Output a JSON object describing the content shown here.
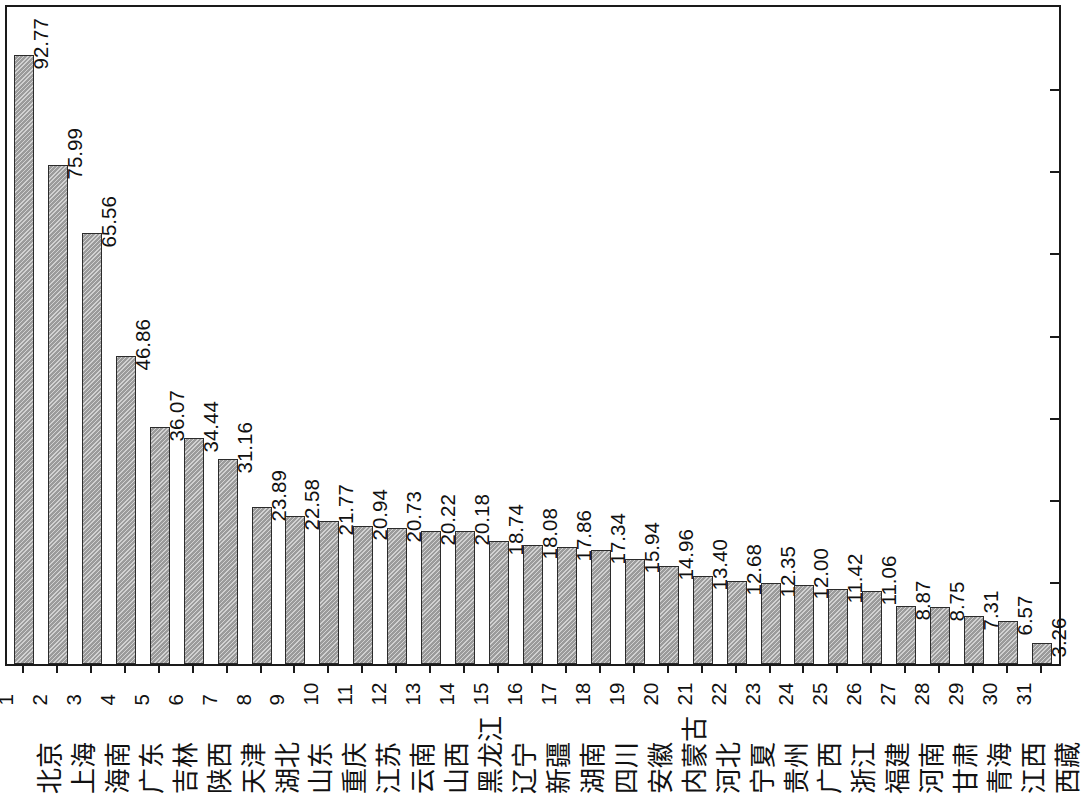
{
  "chart_data": {
    "type": "bar",
    "title": "",
    "subtitle": "",
    "xlabel": "",
    "ylabel": "",
    "ylim": [
      0,
      100
    ],
    "grid": false,
    "legend": false,
    "axis": {
      "y_ticks_labeled": false,
      "y_tick_count": 7,
      "x_tick_marks": true,
      "value_labels_rotated_deg": 90,
      "category_labels_rotated_deg": 90
    },
    "style": {
      "bar_fill": "#9b9b9b",
      "bar_border": "#2b2b2b",
      "frame_color": "#1a1a1a",
      "background": "#ffffff",
      "text_color": "#111111"
    },
    "categories": [
      "北京",
      "上海",
      "海南",
      "广东",
      "吉林",
      "陕西",
      "天津",
      "湖北",
      "山东",
      "重庆",
      "江苏",
      "云南",
      "山西",
      "黑龙江",
      "辽宁",
      "新疆",
      "湖南",
      "四川",
      "安徽",
      "内蒙古",
      "河北",
      "宁夏",
      "贵州",
      "广西",
      "浙江",
      "福建",
      "河南",
      "甘肃",
      "青海",
      "江西",
      "西藏"
    ],
    "index_labels": [
      "1",
      "2",
      "3",
      "4",
      "5",
      "6",
      "7",
      "8",
      "9",
      "10",
      "11",
      "12",
      "13",
      "14",
      "15",
      "16",
      "17",
      "18",
      "19",
      "20",
      "21",
      "22",
      "23",
      "24",
      "25",
      "26",
      "27",
      "28",
      "29",
      "30",
      "31"
    ],
    "values": [
      92.77,
      75.99,
      65.56,
      46.86,
      36.07,
      34.44,
      31.16,
      23.89,
      22.58,
      21.77,
      20.94,
      20.73,
      20.22,
      20.18,
      18.74,
      18.08,
      17.86,
      17.34,
      15.94,
      14.96,
      13.4,
      12.68,
      12.35,
      12.0,
      11.42,
      11.06,
      8.87,
      8.75,
      7.31,
      6.57,
      3.26
    ],
    "value_labels": [
      "92.77",
      "75.99",
      "65.56",
      "46.86",
      "36.07",
      "34.44",
      "31.16",
      "23.89",
      "22.58",
      "21.77",
      "20.94",
      "20.73",
      "20.22",
      "20.18",
      "18.74",
      "18.08",
      "17.86",
      "17.34",
      "15.94",
      "14.96",
      "13.40",
      "12.68",
      "12.35",
      "12.00",
      "11.42",
      "11.06",
      "8.87",
      "8.75",
      "7.31",
      "6.57",
      "3.26"
    ]
  }
}
